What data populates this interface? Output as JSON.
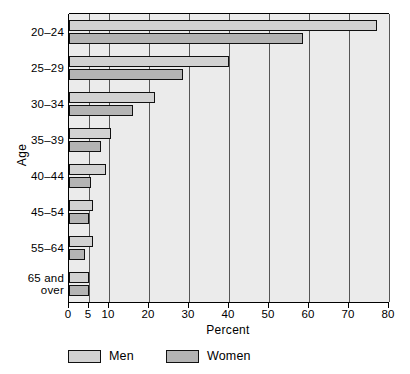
{
  "chart_data": {
    "type": "bar",
    "orientation": "horizontal",
    "title": "",
    "xlabel": "Percent",
    "ylabel": "Age",
    "xlim": [
      0,
      80
    ],
    "grid": true,
    "legend_position": "bottom-left",
    "categories": [
      "20–24",
      "25–29",
      "30–34",
      "35–39",
      "40–44",
      "45–54",
      "55–64",
      "65 and\nover"
    ],
    "xticks": [
      0,
      5,
      10,
      20,
      30,
      40,
      50,
      60,
      70,
      80
    ],
    "xticklabels": [
      "0",
      "5",
      "10",
      "20",
      "30",
      "40",
      "50",
      "60",
      "70",
      "80"
    ],
    "series": [
      {
        "name": "Men",
        "color": "#d2d2d2",
        "values": [
          77,
          40,
          21.5,
          10.5,
          9.2,
          6,
          6,
          5
        ]
      },
      {
        "name": "Women",
        "color": "#b4b4b4",
        "values": [
          58.5,
          28.5,
          16,
          8,
          5.5,
          5,
          4,
          5
        ]
      }
    ]
  },
  "legend": {
    "items": [
      {
        "label": "Men",
        "color": "#d2d2d2"
      },
      {
        "label": "Women",
        "color": "#b4b4b4"
      }
    ]
  },
  "axes": {
    "x_title": "Percent",
    "y_title": "Age"
  }
}
